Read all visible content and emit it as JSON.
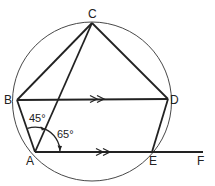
{
  "diagram": {
    "type": "geometry",
    "points": {
      "A": {
        "label": "A",
        "x": 35,
        "y": 152
      },
      "B": {
        "label": "B",
        "x": 17,
        "y": 100
      },
      "C": {
        "label": "C",
        "x": 92,
        "y": 23
      },
      "D": {
        "label": "D",
        "x": 168,
        "y": 99
      },
      "E": {
        "label": "E",
        "x": 152,
        "y": 152
      },
      "F": {
        "label": "F",
        "x": 203,
        "y": 152
      }
    },
    "circle": {
      "cx": 92,
      "cy": 101.5,
      "r": 79.5
    },
    "segments": [
      "AB",
      "BC",
      "CD",
      "DE",
      "AC",
      "BD",
      "AF"
    ],
    "parallel_marks": [
      "BD",
      "AE"
    ],
    "angles": [
      {
        "label": "45°",
        "between": "BA-AC",
        "vertex": "A"
      },
      {
        "label": "65°",
        "between": "CA-AE",
        "vertex": "A"
      }
    ]
  },
  "labels": {
    "A": "A",
    "B": "B",
    "C": "C",
    "D": "D",
    "E": "E",
    "F": "F",
    "angle_45": "45°",
    "angle_65": "65°"
  }
}
